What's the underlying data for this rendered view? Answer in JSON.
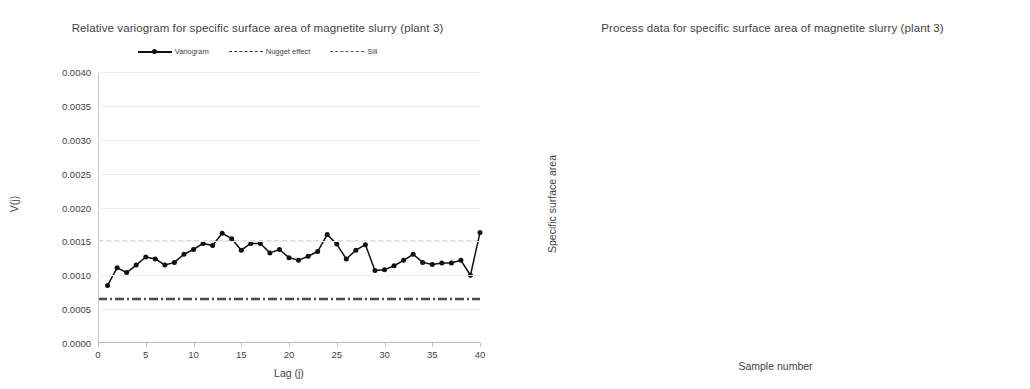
{
  "charts": {
    "left": {
      "title": "Relative variogram for specific surface area of magnetite slurry (plant 3)",
      "xlabel": "Lag (j)",
      "ylabel": "V(j)",
      "legend": [
        {
          "label": "Variogram",
          "key": "solid-marker-line"
        },
        {
          "label": "Nugget effect",
          "key": "dash-dot-line"
        },
        {
          "label": "Sill",
          "key": "dashed-line"
        }
      ]
    },
    "right": {
      "title": "Process data for specific surface area of magnetite slurry (plant 3)",
      "xlabel": "Sample number",
      "ylabel": "Specific surface area"
    }
  },
  "chart_data": [
    {
      "id": "relative-variogram",
      "type": "line",
      "title": "Relative variogram for specific surface area of magnetite slurry (plant 3)",
      "xlabel": "Lag (j)",
      "ylabel": "V(j)",
      "xlim": [
        0,
        40
      ],
      "ylim": [
        0.0,
        0.004
      ],
      "xticks": [
        0,
        5,
        10,
        15,
        20,
        25,
        30,
        35,
        40
      ],
      "yticks": [
        0.0,
        0.0005,
        0.001,
        0.0015,
        0.002,
        0.0025,
        0.003,
        0.0035,
        0.004
      ],
      "ytick_labels": [
        "0.0000",
        "0.0005",
        "0.0010",
        "0.0015",
        "0.0020",
        "0.0025",
        "0.0030",
        "0.0035",
        "0.0040"
      ],
      "xtick_labels": [
        "0",
        "5",
        "10",
        "15",
        "20",
        "25",
        "30",
        "35",
        "40"
      ],
      "grid": true,
      "legend": [
        "Variogram",
        "Nugget effect",
        "Sill"
      ],
      "legend_position": "top",
      "reference_lines": [
        {
          "name": "Sill",
          "value": 0.0015,
          "style": "dashed"
        },
        {
          "name": "Nugget effect",
          "value": 0.00065,
          "style": "dash-dot"
        }
      ],
      "series": [
        {
          "name": "Variogram",
          "x": [
            1,
            2,
            3,
            4,
            5,
            6,
            7,
            8,
            9,
            10,
            11,
            12,
            13,
            14,
            15,
            16,
            17,
            18,
            19,
            20,
            21,
            22,
            23,
            24,
            25,
            26,
            27,
            28,
            29,
            30,
            31,
            32,
            33,
            34,
            35,
            36,
            37,
            38,
            39,
            40
          ],
          "values": [
            0.00085,
            0.00111,
            0.00104,
            0.00115,
            0.00127,
            0.00124,
            0.00115,
            0.00119,
            0.00131,
            0.00138,
            0.00147,
            0.00144,
            0.00162,
            0.00154,
            0.00137,
            0.00147,
            0.00147,
            0.00133,
            0.00138,
            0.00126,
            0.00122,
            0.00128,
            0.00135,
            0.0016,
            0.00146,
            0.00124,
            0.00137,
            0.00145,
            0.00107,
            0.00108,
            0.00114,
            0.00122,
            0.00131,
            0.00119,
            0.00116,
            0.00118,
            0.00118,
            0.00122,
            0.001,
            0.00163
          ]
        }
      ]
    },
    {
      "id": "process-data",
      "type": "line",
      "title": "Process data for specific surface area of magnetite slurry (plant 3)",
      "xlabel": "Sample number",
      "ylabel": "Specific surface area",
      "xlim": [
        0,
        100
      ],
      "xticks": [
        0,
        10,
        20,
        30,
        40,
        50,
        60,
        70,
        80,
        90,
        100
      ],
      "xtick_labels": [
        "0",
        "10",
        "20",
        "30",
        "40",
        "50",
        "60",
        "70",
        "80",
        "90",
        "100"
      ],
      "ytick_labels": [],
      "grid": true,
      "legend_position": "none",
      "series": [
        {
          "name": "Specific surface area",
          "x": [
            1,
            2,
            3,
            4,
            5,
            6,
            7,
            8,
            9,
            10,
            11,
            12,
            13,
            14,
            15,
            16,
            17,
            18,
            19,
            20,
            21,
            22,
            23,
            24,
            25,
            26,
            27,
            28,
            29,
            30,
            31,
            32,
            33,
            34,
            35,
            36,
            37,
            38,
            39,
            40,
            41,
            42,
            43,
            44,
            45,
            46,
            47,
            48,
            49,
            50,
            51,
            52,
            53,
            54,
            55,
            56,
            57,
            58,
            59,
            60,
            61,
            62,
            63,
            64,
            65,
            66,
            67,
            68,
            69,
            70,
            71,
            72,
            73,
            74,
            75,
            76,
            77,
            78,
            79,
            80,
            81,
            82,
            83,
            84,
            85,
            86,
            87,
            88,
            89,
            90,
            91,
            92,
            93,
            94,
            95,
            96,
            97,
            98,
            99,
            100
          ],
          "values": [
            1.48,
            1.46,
            1.56,
            1.72,
            1.51,
            1.22,
            1.47,
            1.63,
            1.45,
            1.58,
            1.46,
            1.56,
            1.44,
            1.62,
            1.43,
            1.38,
            1.34,
            1.47,
            1.72,
            1.41,
            1.29,
            1.27,
            1.49,
            1.55,
            1.44,
            1.52,
            1.46,
            1.79,
            1.63,
            3.28,
            1.78,
            1.78,
            1.42,
            1.41,
            1.65,
            1.69,
            1.63,
            1.68,
            1.75,
            1.62,
            1.68,
            1.78,
            1.45,
            1.57,
            1.77,
            1.71,
            1.62,
            1.69,
            1.75,
            1.67,
            1.69,
            1.58,
            1.53,
            1.58,
            1.62,
            1.44,
            1.71,
            1.77,
            1.6,
            1.48,
            1.5,
            1.49,
            1.43,
            1.62,
            1.78,
            1.56,
            1.53,
            1.06,
            1.44,
            1.54,
            1.56,
            1.66,
            1.7,
            1.58,
            1.65,
            1.72,
            1.57,
            1.66,
            1.56,
            1.68,
            1.95,
            1.59,
            1.49,
            1.52,
            1.63,
            1.44,
            1.46,
            1.6,
            1.66,
            1.58,
            1.65,
            1.72,
            1.69,
            1.58,
            1.55,
            1.53,
            1.62,
            1.59,
            1.58,
            1.48
          ]
        }
      ]
    }
  ]
}
